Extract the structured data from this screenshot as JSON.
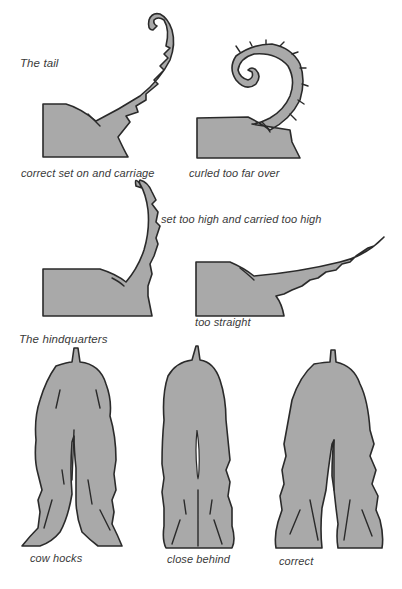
{
  "sections": {
    "tail": {
      "heading": "The tail",
      "figures": [
        {
          "id": "tail-correct",
          "caption": "correct set on and carriage"
        },
        {
          "id": "tail-curled",
          "caption": "curled too far over"
        },
        {
          "id": "tail-high",
          "caption": "set too high and carried too high"
        },
        {
          "id": "tail-straight",
          "caption": "too straight"
        }
      ]
    },
    "hindquarters": {
      "heading": "The hindquarters",
      "figures": [
        {
          "id": "hind-cow-hocks",
          "caption": "cow hocks"
        },
        {
          "id": "hind-close-behind",
          "caption": "close behind"
        },
        {
          "id": "hind-correct",
          "caption": "correct"
        }
      ]
    }
  },
  "colors": {
    "fill": "#a9a9a9",
    "outline": "#2a2a2a",
    "text": "#3a3a3a",
    "background": "#ffffff"
  }
}
